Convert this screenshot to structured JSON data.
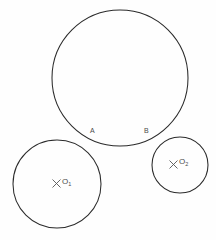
{
  "figure": {
    "background_color": "#fefefe",
    "stroke_color": "#2b2b2b",
    "label_color": "#4a4a4a",
    "width": 216,
    "height": 240
  },
  "labels": {
    "point_a": "A",
    "point_b": "B",
    "center_o1": "O",
    "center_o1_sub": "1",
    "center_o2": "O",
    "center_o2_sub": "2"
  },
  "chart_data": {
    "type": "diagram",
    "subtype": "euclidean-circle-construction",
    "units": "pixels",
    "shapes": [
      {
        "name": "large-circle",
        "kind": "circle",
        "cx": 120,
        "cy": 78,
        "r": 68,
        "label": "",
        "stroke": "#2b2b2b"
      },
      {
        "name": "circle-o1",
        "kind": "circle",
        "cx": 57,
        "cy": 184,
        "r": 44,
        "label": "O1",
        "stroke": "#2b2b2b"
      },
      {
        "name": "circle-o2",
        "kind": "circle",
        "cx": 180,
        "cy": 165,
        "r": 28,
        "label": "O2",
        "stroke": "#2b2b2b"
      }
    ],
    "points": [
      {
        "name": "A",
        "x": 92,
        "y": 133,
        "kind": "tangency-point"
      },
      {
        "name": "B",
        "x": 146,
        "y": 133,
        "kind": "tangency-point"
      },
      {
        "name": "O1",
        "x": 57,
        "y": 184,
        "kind": "center-mark"
      },
      {
        "name": "O2",
        "x": 180,
        "y": 165,
        "kind": "center-mark"
      }
    ],
    "annotations": [
      "Circle O1 is tangent to the large circle near point A",
      "Circle O2 is tangent to the large circle near point B",
      "Centers O1 and O2 are marked with small x crosses"
    ],
    "grid": false,
    "legend": null
  }
}
